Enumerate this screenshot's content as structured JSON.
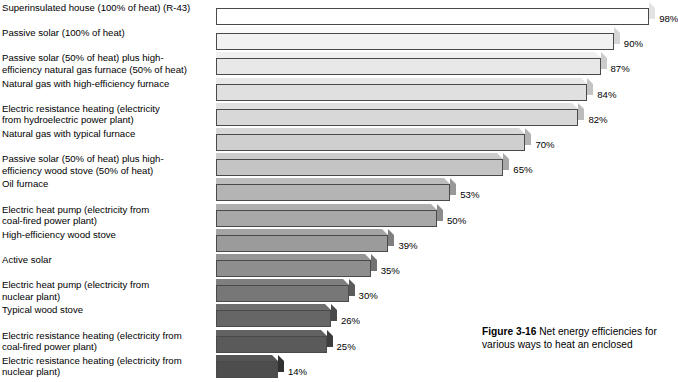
{
  "caption": {
    "figure_label": "Figure 3-16",
    "text": "Net energy efficiencies for various ways to heat an enclosed"
  },
  "chart_data": {
    "type": "bar",
    "orientation": "horizontal",
    "title": "",
    "xlabel": "",
    "ylabel": "",
    "xlim": [
      0,
      100
    ],
    "grid": false,
    "legend": false,
    "value_suffix": "%",
    "categories": [
      "Superinsulated house (100% of heat) (R-43)",
      "Passive solar (100% of heat)",
      "Passive solar (50% of heat) plus high-\nefficiency natural gas furnace (50% of heat)",
      "Natural gas with high-efficiency furnace",
      "Electric resistance heating (electricity\nfrom hydroelectric power plant)",
      "Natural gas with typical furnace",
      "Passive solar (50% of heat) plus high-\nefficiency wood stove (50% of heat)",
      "Oil furnace",
      "Electric heat pump (electricity from\ncoal-fired power plant)",
      "High-efficiency wood stove",
      "Active solar",
      "Electric heat pump (electricity from\nnuclear plant)",
      "Typical wood stove",
      "Electric resistance heating (electricity from\ncoal-fired power plant)",
      "Electric resistance heating (electricity from\nnuclear plant)"
    ],
    "values": [
      98,
      90,
      87,
      84,
      82,
      70,
      65,
      53,
      50,
      39,
      35,
      30,
      26,
      25,
      14
    ],
    "labels": [
      "98%",
      "90%",
      "87%",
      "84%",
      "82%",
      "70%",
      "65%",
      "53%",
      "50%",
      "39%",
      "35%",
      "30%",
      "26%",
      "25%",
      "14%"
    ],
    "bar_colors": [
      "#ffffff",
      "#f2f2f2",
      "#e8e8e8",
      "#e0e0e0",
      "#d8d8d8",
      "#cfcfcf",
      "#c4c4c4",
      "#b4b4b4",
      "#a8a8a8",
      "#9b9b9b",
      "#8e8e8e",
      "#777777",
      "#666666",
      "#5a5a5a",
      "#4d4d4d"
    ]
  }
}
